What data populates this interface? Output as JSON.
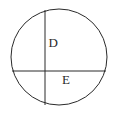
{
  "diagram": {
    "type": "circle-with-two-chords",
    "stroke_color": "#2a2a2a",
    "background_color": "#ffffff",
    "circle": {
      "cx": 59,
      "cy": 57,
      "r": 48
    },
    "chords": [
      {
        "name": "vertical-chord",
        "x1": 45,
        "y1": 10,
        "x2": 45,
        "y2": 105
      },
      {
        "name": "horizontal-chord",
        "x1": 13,
        "y1": 71,
        "x2": 106,
        "y2": 71
      }
    ],
    "labels": {
      "region_d": "D",
      "region_e": "E"
    }
  }
}
